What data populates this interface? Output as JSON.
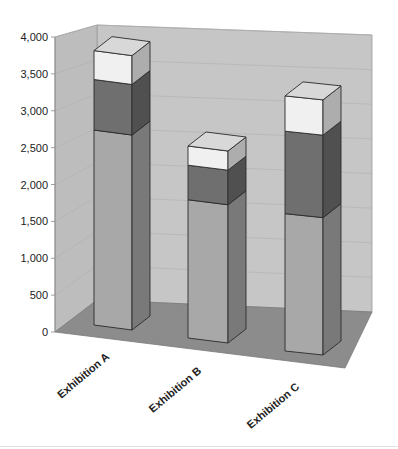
{
  "chart_data": {
    "type": "bar",
    "subtype": "stacked-3d-column",
    "title": "",
    "xlabel": "",
    "ylabel": "",
    "categories": [
      "Exhibition A",
      "Exhibition B",
      "Exhibition C"
    ],
    "series": [
      {
        "name": "Series 1",
        "color": "#a8a8a8",
        "values": [
          2700,
          1800,
          1750
        ]
      },
      {
        "name": "Series 2",
        "color": "#6f6f6f",
        "values": [
          700,
          450,
          1050
        ]
      },
      {
        "name": "Series 3",
        "color": "#f0f0f0",
        "values": [
          400,
          250,
          450
        ]
      }
    ],
    "totals": [
      3800,
      2500,
      3250
    ],
    "ylim": [
      0,
      4000
    ],
    "yticks": [
      0,
      500,
      1000,
      1500,
      2000,
      2500,
      3000,
      3500,
      4000
    ],
    "ytick_labels": [
      "0",
      "500",
      "1,000",
      "1,500",
      "2,000",
      "2,500",
      "3,000",
      "3,500",
      "4,000"
    ],
    "grid": true,
    "legend": "none"
  },
  "colors": {
    "back_wall": "#c6c6c6",
    "side_wall": "#bdbdbd",
    "floor": "#8c8c8c",
    "outline": "#2a2a2a"
  }
}
